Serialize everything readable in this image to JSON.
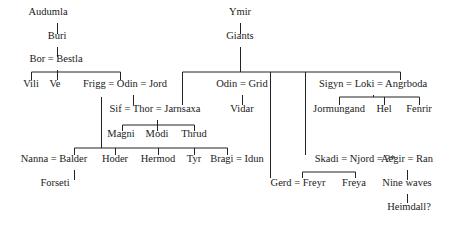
{
  "diagram": {
    "type": "family-tree",
    "nodes": [
      {
        "id": "audumla",
        "label": "Audumla",
        "x": 48,
        "y": 12
      },
      {
        "id": "buri",
        "label": "Buri",
        "x": 57,
        "y": 36
      },
      {
        "id": "bor-bestla",
        "label": "Bor = Bestla",
        "x": 56,
        "y": 59
      },
      {
        "id": "vili",
        "label": "Vili",
        "x": 31,
        "y": 84
      },
      {
        "id": "ve",
        "label": "Ve",
        "x": 55,
        "y": 84
      },
      {
        "id": "frigg-odin-jord",
        "label": "Frigg = Odin = Jord",
        "x": 125,
        "y": 84
      },
      {
        "id": "sif-thor-jarnsaxa",
        "label": "Sif = Thor = Jarnsaxa",
        "x": 155,
        "y": 109
      },
      {
        "id": "magni",
        "label": "Magni",
        "x": 121,
        "y": 134
      },
      {
        "id": "modi",
        "label": "Modi",
        "x": 157,
        "y": 134
      },
      {
        "id": "thrud",
        "label": "Thrud",
        "x": 194,
        "y": 134
      },
      {
        "id": "nanna-balder",
        "label": "Nanna = Balder",
        "x": 54,
        "y": 159
      },
      {
        "id": "forseti",
        "label": "Forseti",
        "x": 55,
        "y": 183
      },
      {
        "id": "hoder",
        "label": "Hoder",
        "x": 115,
        "y": 159
      },
      {
        "id": "hermod",
        "label": "Hermod",
        "x": 158,
        "y": 159
      },
      {
        "id": "tyr",
        "label": "Tyr",
        "x": 194,
        "y": 159
      },
      {
        "id": "bragi-idun",
        "label": "Bragi = Idun",
        "x": 237,
        "y": 159
      },
      {
        "id": "ymir",
        "label": "Ymir",
        "x": 240,
        "y": 12
      },
      {
        "id": "giants",
        "label": "Giants",
        "x": 240,
        "y": 36
      },
      {
        "id": "odin-grid",
        "label": "Odin = Grid",
        "x": 242,
        "y": 84
      },
      {
        "id": "vidar",
        "label": "Vidar",
        "x": 242,
        "y": 109
      },
      {
        "id": "sigyn-loki-angrboda",
        "label": "Sigyn = Loki = Angrboda",
        "x": 373,
        "y": 84
      },
      {
        "id": "jormungand",
        "label": "Jormungand",
        "x": 339,
        "y": 109
      },
      {
        "id": "hel",
        "label": "Hel",
        "x": 384,
        "y": 109
      },
      {
        "id": "fenrir",
        "label": "Fenrir",
        "x": 419,
        "y": 109
      },
      {
        "id": "skadi-njord",
        "label": "Skadi = Njord = ?*",
        "x": 355,
        "y": 159
      },
      {
        "id": "gerd-freyr",
        "label": "Gerd = Freyr",
        "x": 298,
        "y": 183
      },
      {
        "id": "freya",
        "label": "Freya",
        "x": 354,
        "y": 183
      },
      {
        "id": "aegir-ran",
        "label": "Aegir = Ran",
        "x": 407,
        "y": 159
      },
      {
        "id": "nine-waves",
        "label": "Nine waves",
        "x": 407,
        "y": 183
      },
      {
        "id": "heimdall",
        "label": "Heimdall?",
        "x": 409,
        "y": 207
      }
    ],
    "lines": [
      [
        57,
        23,
        57,
        34
      ],
      [
        57,
        47,
        57,
        57
      ],
      [
        57,
        70,
        57,
        80
      ],
      [
        31,
        72,
        120,
        72
      ],
      [
        31,
        72,
        31,
        80
      ],
      [
        120,
        72,
        120,
        80
      ],
      [
        133,
        95,
        133,
        105
      ],
      [
        101,
        97,
        101,
        148
      ],
      [
        157,
        120,
        157,
        125
      ],
      [
        122,
        125,
        194,
        125
      ],
      [
        122,
        125,
        122,
        131
      ],
      [
        194,
        125,
        194,
        131
      ],
      [
        157,
        125,
        157,
        131
      ],
      [
        74,
        148,
        227,
        148
      ],
      [
        74,
        148,
        74,
        155
      ],
      [
        115,
        148,
        115,
        155
      ],
      [
        158,
        148,
        158,
        155
      ],
      [
        194,
        148,
        194,
        155
      ],
      [
        227,
        148,
        227,
        155
      ],
      [
        74,
        170,
        74,
        180
      ],
      [
        240,
        23,
        240,
        34
      ],
      [
        240,
        47,
        240,
        72
      ],
      [
        182,
        72,
        400,
        72
      ],
      [
        182,
        72,
        182,
        105
      ],
      [
        242,
        95,
        242,
        105
      ],
      [
        270,
        72,
        270,
        178
      ],
      [
        305,
        72,
        305,
        155
      ],
      [
        400,
        72,
        400,
        80
      ],
      [
        339,
        97,
        419,
        97
      ],
      [
        339,
        97,
        339,
        105
      ],
      [
        384,
        97,
        384,
        105
      ],
      [
        419,
        97,
        419,
        105
      ],
      [
        373,
        95,
        373,
        97
      ],
      [
        302,
        172,
        355,
        172
      ],
      [
        302,
        172,
        302,
        178
      ],
      [
        355,
        172,
        355,
        178
      ],
      [
        407,
        170,
        407,
        180
      ],
      [
        407,
        194,
        407,
        203
      ]
    ]
  }
}
